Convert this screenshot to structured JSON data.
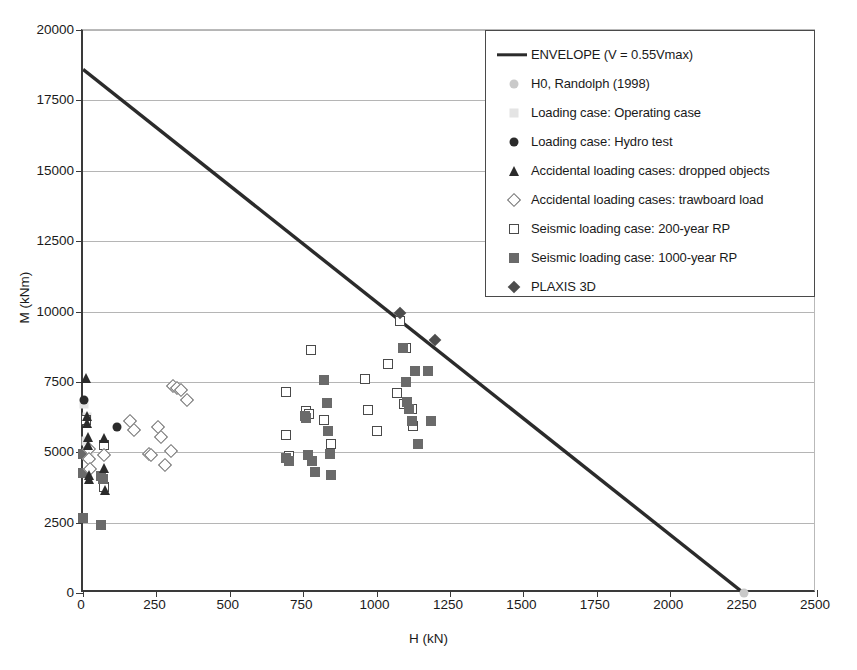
{
  "chart_data": {
    "type": "scatter",
    "title": "",
    "xlabel": "H (kN)",
    "ylabel": "M (kNm)",
    "xlim": [
      0,
      2500
    ],
    "ylim": [
      0,
      20000
    ],
    "xticks": [
      0,
      250,
      500,
      750,
      1000,
      1250,
      1500,
      1750,
      2000,
      2250,
      2500
    ],
    "yticks": [
      0,
      2500,
      5000,
      7500,
      10000,
      12500,
      15000,
      17500,
      20000
    ],
    "grid": "horizontal",
    "legend_position": "upper-right",
    "series": [
      {
        "name": "ENVELOPE (V = 0.55Vmax)",
        "marker": "line",
        "color": "#2b2b2b",
        "type": "line",
        "points": [
          [
            0,
            18600
          ],
          [
            2250,
            0
          ]
        ]
      },
      {
        "name": "H0, Randolph (1998)",
        "marker": "circle-light",
        "color": "#c9c9c9",
        "points": [
          [
            2250,
            0
          ]
        ]
      },
      {
        "name": "Loading case: Operating case",
        "marker": "square-light",
        "color": "#e4e4e4",
        "points": [
          [
            5,
            6700
          ],
          [
            15,
            6250
          ],
          [
            10,
            5400
          ],
          [
            20,
            4900
          ]
        ]
      },
      {
        "name": "Loading case: Hydro test",
        "marker": "circle-dark",
        "color": "#2b2b2b",
        "points": [
          [
            5,
            6850
          ],
          [
            115,
            5900
          ]
        ]
      },
      {
        "name": "Accidental loading cases: dropped objects",
        "marker": "triangle-dark",
        "color": "#2b2b2b",
        "points": [
          [
            10,
            7650
          ],
          [
            12,
            6300
          ],
          [
            14,
            6050
          ],
          [
            16,
            5550
          ],
          [
            18,
            5250
          ],
          [
            20,
            4200
          ],
          [
            22,
            4050
          ],
          [
            70,
            5500
          ],
          [
            72,
            4450
          ],
          [
            74,
            3650
          ]
        ]
      },
      {
        "name": "Accidental loading cases: trawboard load",
        "marker": "diamond-open",
        "color": "#6d6d6d",
        "points": [
          [
            20,
            5100
          ],
          [
            22,
            4750
          ],
          [
            24,
            4400
          ],
          [
            70,
            4900
          ],
          [
            160,
            6100
          ],
          [
            175,
            5800
          ],
          [
            225,
            4950
          ],
          [
            230,
            4900
          ],
          [
            255,
            5900
          ],
          [
            265,
            5550
          ],
          [
            280,
            4550
          ],
          [
            305,
            7350
          ],
          [
            320,
            7300
          ],
          [
            335,
            7200
          ],
          [
            355,
            6850
          ],
          [
            300,
            5050
          ]
        ]
      },
      {
        "name": "Seismic loading case: 200-year RP",
        "marker": "square-open",
        "color": "#4a4a4a",
        "points": [
          [
            10,
            6150
          ],
          [
            70,
            5250
          ],
          [
            72,
            3750
          ],
          [
            690,
            7150
          ],
          [
            690,
            5600
          ],
          [
            700,
            4850
          ],
          [
            760,
            6450
          ],
          [
            770,
            6350
          ],
          [
            775,
            8650
          ],
          [
            820,
            6150
          ],
          [
            845,
            5300
          ],
          [
            960,
            7600
          ],
          [
            970,
            6500
          ],
          [
            1000,
            5750
          ],
          [
            1040,
            8150
          ],
          [
            1070,
            7100
          ],
          [
            1080,
            9650
          ],
          [
            1095,
            6700
          ],
          [
            1100,
            8700
          ],
          [
            1120,
            6550
          ],
          [
            1125,
            5950
          ]
        ]
      },
      {
        "name": "Seismic loading case: 1000-year RP",
        "marker": "square-fill",
        "color": "#6a6a6a",
        "points": [
          [
            0,
            4950
          ],
          [
            0,
            2650
          ],
          [
            0,
            4250
          ],
          [
            60,
            2400
          ],
          [
            62,
            4150
          ],
          [
            68,
            4050
          ],
          [
            690,
            4800
          ],
          [
            700,
            4700
          ],
          [
            755,
            6300
          ],
          [
            760,
            6200
          ],
          [
            765,
            4900
          ],
          [
            780,
            4700
          ],
          [
            790,
            4300
          ],
          [
            820,
            7550
          ],
          [
            830,
            6750
          ],
          [
            835,
            5750
          ],
          [
            840,
            4950
          ],
          [
            845,
            4200
          ],
          [
            1090,
            8700
          ],
          [
            1100,
            7500
          ],
          [
            1105,
            6800
          ],
          [
            1110,
            6550
          ],
          [
            1120,
            6100
          ],
          [
            1130,
            7900
          ],
          [
            1140,
            5300
          ],
          [
            1175,
            7900
          ],
          [
            1185,
            6100
          ]
        ]
      },
      {
        "name": "PLAXIS 3D",
        "marker": "diamond-fill",
        "color": "#4d4d4d",
        "points": [
          [
            1080,
            9950
          ],
          [
            1200,
            9000
          ]
        ]
      }
    ]
  },
  "legend": {
    "items": [
      {
        "label": "ENVELOPE (V = 0.55Vmax)",
        "marker": "line"
      },
      {
        "label": "H0, Randolph (1998)",
        "marker": "circle-light"
      },
      {
        "label": "Loading case: Operating case",
        "marker": "square-light"
      },
      {
        "label": "Loading case: Hydro test",
        "marker": "circle-dark"
      },
      {
        "label": "Accidental loading cases: dropped objects",
        "marker": "triangle-dark"
      },
      {
        "label": "Accidental loading cases: trawboard load",
        "marker": "diamond-open"
      },
      {
        "label": "Seismic loading case: 200-year RP",
        "marker": "square-open"
      },
      {
        "label": "Seismic loading case: 1000-year RP",
        "marker": "square-fill"
      },
      {
        "label": "PLAXIS 3D",
        "marker": "diamond-fill"
      }
    ]
  }
}
